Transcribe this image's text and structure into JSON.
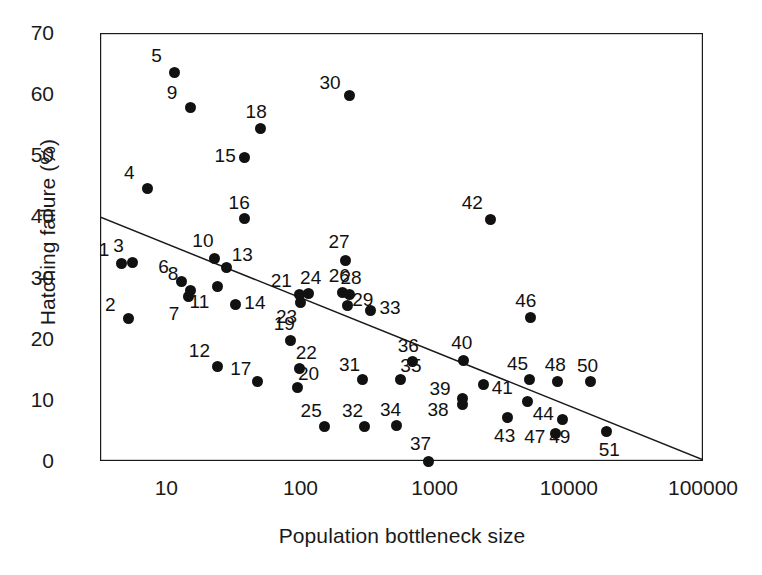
{
  "chart_data": {
    "type": "scatter",
    "title": "",
    "xlabel": "Population bottleneck size",
    "ylabel": "Hatching failure (%)",
    "xscale": "log",
    "xlim": [
      3.2,
      100000
    ],
    "ylim": [
      0,
      70
    ],
    "xticks": [
      10,
      100,
      1000,
      10000,
      100000
    ],
    "xtick_labels": [
      "10",
      "100",
      "1000",
      "10000",
      "100000"
    ],
    "yticks": [
      0,
      10,
      20,
      30,
      40,
      50,
      60,
      70
    ],
    "ytick_labels": [
      "0",
      "10",
      "20",
      "30",
      "40",
      "50",
      "60",
      "70"
    ],
    "grid": false,
    "legend": "none",
    "minor_ticks": "log-decade",
    "point_label_style": "numeric-id",
    "trendline": {
      "type": "linear-on-log-x",
      "x_start": 3.2,
      "y_start": 39.9,
      "x_end": 100000,
      "y_end": 0.2
    },
    "points": [
      {
        "id": "1",
        "x": 4.6,
        "y": 32.3
      },
      {
        "id": "2",
        "x": 5.2,
        "y": 23.3
      },
      {
        "id": "3",
        "x": 5.6,
        "y": 32.5
      },
      {
        "id": "4",
        "x": 7.2,
        "y": 44.5
      },
      {
        "id": "5",
        "x": 11.5,
        "y": 63.6
      },
      {
        "id": "6",
        "x": 13.0,
        "y": 29.3
      },
      {
        "id": "7",
        "x": 14.5,
        "y": 26.9
      },
      {
        "id": "8",
        "x": 15.0,
        "y": 27.9
      },
      {
        "id": "9",
        "x": 15.0,
        "y": 57.8
      },
      {
        "id": "10",
        "x": 23.0,
        "y": 33.2
      },
      {
        "id": "11",
        "x": 24.0,
        "y": 28.6
      },
      {
        "id": "12",
        "x": 24.0,
        "y": 15.5
      },
      {
        "id": "13",
        "x": 28.0,
        "y": 31.6
      },
      {
        "id": "14",
        "x": 33.0,
        "y": 25.6
      },
      {
        "id": "15",
        "x": 38.0,
        "y": 49.6
      },
      {
        "id": "16",
        "x": 38.0,
        "y": 39.6
      },
      {
        "id": "17",
        "x": 48.0,
        "y": 13.0
      },
      {
        "id": "18",
        "x": 50.0,
        "y": 54.3
      },
      {
        "id": "19",
        "x": 84.0,
        "y": 19.7
      },
      {
        "id": "20",
        "x": 95.0,
        "y": 12.1
      },
      {
        "id": "21",
        "x": 98.0,
        "y": 27.2
      },
      {
        "id": "22",
        "x": 98.0,
        "y": 15.2
      },
      {
        "id": "23",
        "x": 100.0,
        "y": 26.0
      },
      {
        "id": "24",
        "x": 115.0,
        "y": 27.4
      },
      {
        "id": "25",
        "x": 150.0,
        "y": 5.6
      },
      {
        "id": "26",
        "x": 205.0,
        "y": 27.6
      },
      {
        "id": "27",
        "x": 215.0,
        "y": 32.8
      },
      {
        "id": "28",
        "x": 230.0,
        "y": 27.2
      },
      {
        "id": "29",
        "x": 225.0,
        "y": 25.5
      },
      {
        "id": "30",
        "x": 230.0,
        "y": 59.7
      },
      {
        "id": "31",
        "x": 290.0,
        "y": 13.4
      },
      {
        "id": "32",
        "x": 300.0,
        "y": 5.6
      },
      {
        "id": "33",
        "x": 330.0,
        "y": 24.6
      },
      {
        "id": "34",
        "x": 520.0,
        "y": 5.8
      },
      {
        "id": "35",
        "x": 560.0,
        "y": 13.3
      },
      {
        "id": "36",
        "x": 680.0,
        "y": 16.2
      },
      {
        "id": "37",
        "x": 900.0,
        "y": 0.0
      },
      {
        "id": "38",
        "x": 1600.0,
        "y": 9.2
      },
      {
        "id": "39",
        "x": 1600.0,
        "y": 10.3
      },
      {
        "id": "40",
        "x": 1650.0,
        "y": 16.5
      },
      {
        "id": "41",
        "x": 2300.0,
        "y": 12.5
      },
      {
        "id": "42",
        "x": 2600.0,
        "y": 39.5
      },
      {
        "id": "43",
        "x": 3500.0,
        "y": 7.1
      },
      {
        "id": "44",
        "x": 4900.0,
        "y": 9.8
      },
      {
        "id": "45",
        "x": 5100.0,
        "y": 13.4
      },
      {
        "id": "46",
        "x": 5200.0,
        "y": 23.4
      },
      {
        "id": "47",
        "x": 8000.0,
        "y": 4.5
      },
      {
        "id": "48",
        "x": 8200.0,
        "y": 13.0
      },
      {
        "id": "49",
        "x": 9000.0,
        "y": 6.8
      },
      {
        "id": "50",
        "x": 14500.0,
        "y": 13.0
      },
      {
        "id": "51",
        "x": 19000.0,
        "y": 4.8
      }
    ],
    "point_label_offsets": {
      "1": [
        -17,
        -15
      ],
      "2": [
        -18,
        -15
      ],
      "3": [
        -14,
        -17
      ],
      "4": [
        -18,
        -17
      ],
      "5": [
        -18,
        -17
      ],
      "6": [
        -18,
        -16
      ],
      "7": [
        -14,
        16
      ],
      "8": [
        -17,
        -17
      ],
      "9": [
        -18,
        -16
      ],
      "10": [
        -12,
        -18
      ],
      "11": [
        -18,
        15
      ],
      "12": [
        -18,
        -16
      ],
      "13": [
        16,
        -14
      ],
      "14": [
        19,
        -2
      ],
      "15": [
        -19,
        -3
      ],
      "16": [
        -5,
        -17
      ],
      "17": [
        -17,
        -14
      ],
      "18": [
        -4,
        -18
      ],
      "19": [
        -6,
        -18
      ],
      "20": [
        11,
        -14
      ],
      "21": [
        -18,
        -15
      ],
      "22": [
        7,
        -16
      ],
      "23": [
        -14,
        14
      ],
      "24": [
        2,
        -16
      ],
      "25": [
        -13,
        -17
      ],
      "26": [
        -3,
        -17
      ],
      "27": [
        -6,
        -19
      ],
      "28": [
        2,
        -18
      ],
      "29": [
        15,
        -6
      ],
      "30": [
        -19,
        -14
      ],
      "31": [
        -13,
        -15
      ],
      "32": [
        -12,
        -17
      ],
      "33": [
        20,
        -4
      ],
      "34": [
        -6,
        -17
      ],
      "35": [
        10,
        -15
      ],
      "36": [
        -4,
        -17
      ],
      "37": [
        -8,
        -18
      ],
      "38": [
        -24,
        4
      ],
      "39": [
        -22,
        -10
      ],
      "40": [
        -2,
        -18
      ],
      "41": [
        19,
        2
      ],
      "42": [
        -18,
        -17
      ],
      "43": [
        -3,
        17
      ],
      "44": [
        16,
        12
      ],
      "45": [
        -12,
        -16
      ],
      "46": [
        -5,
        -18
      ],
      "47": [
        -21,
        3
      ],
      "48": [
        -2,
        -18
      ],
      "49": [
        -3,
        17
      ],
      "50": [
        -3,
        -17
      ],
      "51": [
        3,
        17
      ]
    }
  }
}
